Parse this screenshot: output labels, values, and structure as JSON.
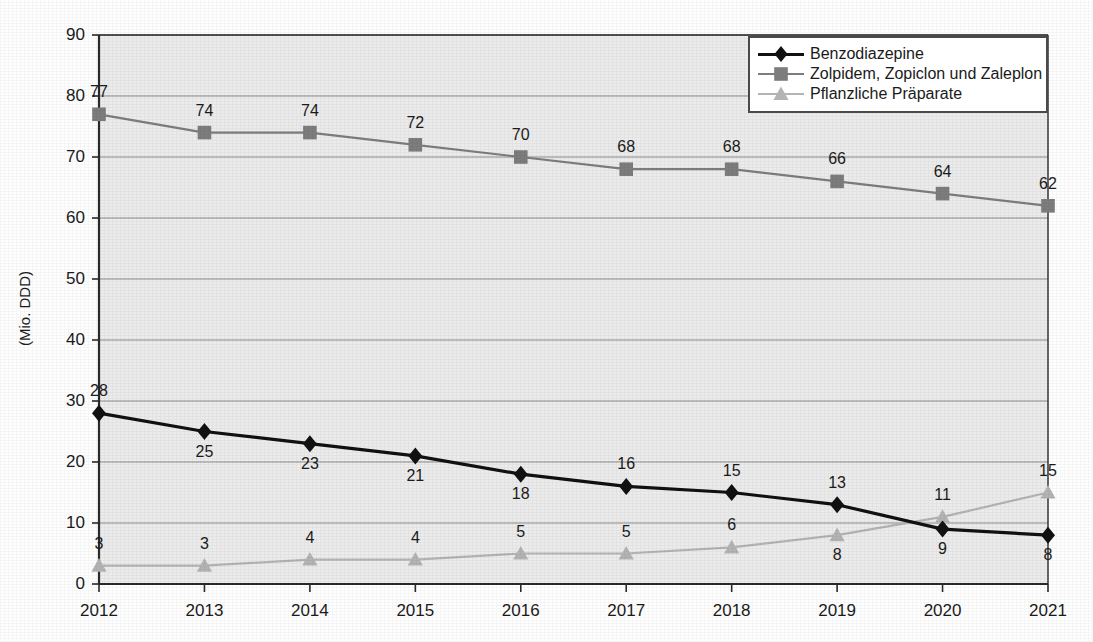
{
  "chart_data": {
    "type": "line",
    "title": "",
    "xlabel": "",
    "ylabel": "(Mio. DDD)",
    "categories": [
      "2012",
      "2013",
      "2014",
      "2015",
      "2016",
      "2017",
      "2018",
      "2019",
      "2020",
      "2021"
    ],
    "ylim": [
      0,
      90
    ],
    "ytick_step": 10,
    "yticks": [
      "0",
      "10",
      "20",
      "30",
      "40",
      "50",
      "60",
      "70",
      "80",
      "90"
    ],
    "grid": true,
    "legend_position": "top-right",
    "series": [
      {
        "name": "Benzodiazepine",
        "marker": "diamond",
        "color": "#111111",
        "values": [
          28,
          25,
          23,
          21,
          18,
          16,
          15,
          13,
          9,
          8
        ],
        "label_positions": [
          "above",
          "below",
          "below",
          "below",
          "below",
          "above",
          "above",
          "above",
          "below",
          "below"
        ]
      },
      {
        "name": "Zolpidem, Zopiclon und Zaleplon",
        "marker": "square",
        "color": "#7d7d7d",
        "values": [
          77,
          74,
          74,
          72,
          70,
          68,
          68,
          66,
          64,
          62
        ],
        "label_positions": [
          "above",
          "above",
          "above",
          "above",
          "above",
          "above",
          "above",
          "above",
          "above",
          "above"
        ]
      },
      {
        "name": "Pflanzliche Präparate",
        "marker": "triangle",
        "color": "#b4b4b4",
        "values": [
          3,
          3,
          4,
          4,
          5,
          5,
          6,
          8,
          11,
          15
        ],
        "label_positions": [
          "above",
          "above",
          "above",
          "above",
          "above",
          "above",
          "above",
          "below",
          "above",
          "above"
        ]
      }
    ],
    "plot_background": "#ececec",
    "gridline_color": "#8c8c8c",
    "axis_color": "#2a2a2a"
  }
}
